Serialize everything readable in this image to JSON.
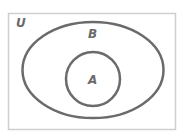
{
  "diagram": {
    "type": "venn",
    "universe": {
      "label": "U"
    },
    "sets": [
      {
        "label": "B",
        "shape": "ellipse"
      },
      {
        "label": "A",
        "shape": "circle",
        "contained_in": "B"
      }
    ],
    "relationship": "A is a subset of B, B is a subset of U"
  },
  "colors": {
    "background": "#ffffff",
    "universe_border": "#cfcfcf",
    "set_outline": "#6b6b6b",
    "label": "#6a6a6a"
  }
}
